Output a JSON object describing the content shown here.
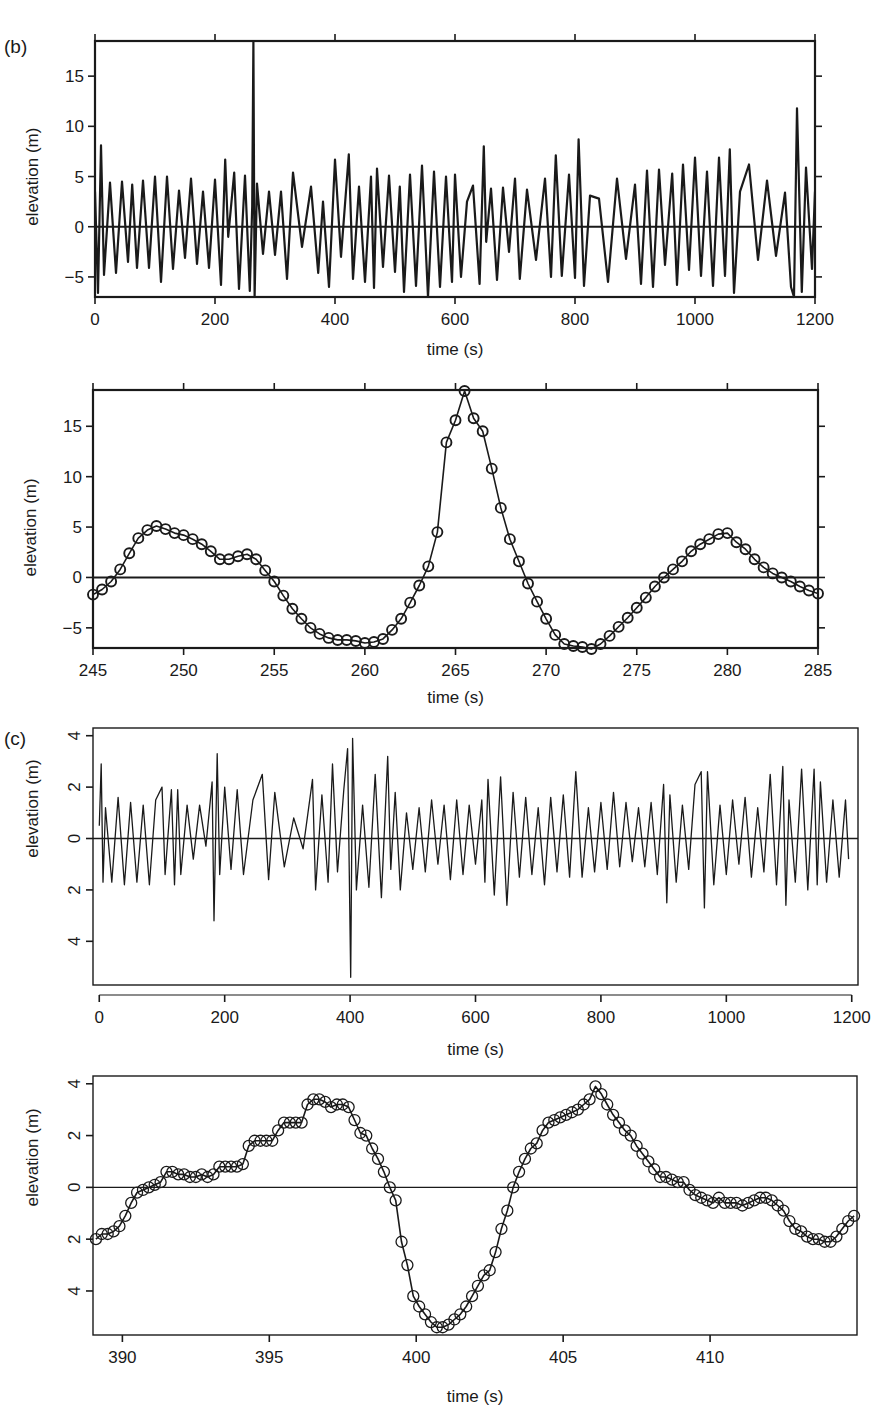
{
  "figure": {
    "panel_labels": {
      "b": "(b)",
      "c": "(c)"
    },
    "ink_color": "#1a1a1a",
    "background": "#ffffff"
  },
  "chart_data": [
    {
      "id": "b-full",
      "panel": "(b)",
      "type": "line",
      "title": "",
      "xlabel": "time (s)",
      "ylabel": "elevation (m)",
      "xlim": [
        0,
        1200
      ],
      "ylim": [
        -7,
        18.5
      ],
      "xticks": [
        0,
        200,
        400,
        600,
        800,
        1000,
        1200
      ],
      "xtick_labels": [
        "0",
        "200",
        "400",
        "600",
        "800",
        "1000",
        "1200"
      ],
      "yticks": [
        -5,
        0,
        5,
        10,
        15
      ],
      "ytick_labels": [
        "−5",
        "0",
        "5",
        "10",
        "15"
      ],
      "zero_line": true,
      "grid": false,
      "markers": false,
      "description": "Wave elevation record ~1200 s long, typical amplitude ±5 m with a single rogue peak near t=264 s reaching ~18.5 m",
      "x": [
        0,
        5,
        10,
        15,
        25,
        35,
        45,
        55,
        62,
        70,
        80,
        90,
        100,
        110,
        120,
        130,
        140,
        150,
        160,
        170,
        180,
        190,
        200,
        210,
        217,
        222,
        232,
        240,
        250,
        258,
        262,
        264,
        266,
        270,
        280,
        290,
        300,
        310,
        320,
        330,
        345,
        360,
        372,
        380,
        390,
        400,
        410,
        423,
        430,
        440,
        450,
        460,
        465,
        470,
        480,
        490,
        500,
        508,
        515,
        525,
        535,
        545,
        555,
        565,
        575,
        585,
        595,
        600,
        610,
        620,
        630,
        641,
        648,
        652,
        660,
        670,
        680,
        690,
        700,
        708,
        720,
        735,
        750,
        760,
        768,
        778,
        790,
        800,
        806,
        815,
        825,
        840,
        855,
        870,
        885,
        900,
        910,
        920,
        930,
        940,
        950,
        962,
        970,
        980,
        990,
        1000,
        1010,
        1020,
        1030,
        1040,
        1050,
        1058,
        1065,
        1075,
        1090,
        1105,
        1120,
        1135,
        1150,
        1160,
        1165,
        1170,
        1178,
        1185,
        1195,
        1200
      ],
      "y": [
        3.5,
        -6.6,
        8.1,
        -4.8,
        4.4,
        -4.6,
        4.5,
        -3.5,
        4.2,
        -4.1,
        4.6,
        -4.1,
        5.0,
        -5.5,
        5.0,
        -4.2,
        3.6,
        -3.1,
        4.8,
        -3.7,
        3.5,
        -4.1,
        4.7,
        -5.8,
        6.7,
        -1.0,
        5.4,
        -6.2,
        5.1,
        -6.4,
        2.0,
        18.5,
        -7.0,
        4.3,
        -2.7,
        3.5,
        -2.8,
        3.5,
        -5.2,
        5.4,
        -2.0,
        4.0,
        -4.6,
        2.5,
        -6.0,
        6.7,
        -3.0,
        7.2,
        -5.2,
        4.0,
        -5.5,
        5.0,
        -6.1,
        5.8,
        -4.0,
        5.1,
        -4.5,
        4.0,
        -6.5,
        5.2,
        -5.9,
        6.1,
        -7.0,
        5.5,
        -6.0,
        5.0,
        -5.5,
        5.2,
        -5.0,
        2.5,
        4.1,
        -5.7,
        8.0,
        -1.5,
        3.8,
        -5.3,
        3.9,
        -2.5,
        4.8,
        -5.2,
        3.7,
        -3.3,
        4.8,
        -5.0,
        7.1,
        -4.9,
        5.2,
        -5.1,
        8.7,
        -5.9,
        3.1,
        2.8,
        -5.5,
        4.8,
        -3.2,
        4.2,
        -5.7,
        5.6,
        -6.0,
        5.7,
        -3.8,
        5.3,
        -5.8,
        6.2,
        -4.3,
        6.9,
        -4.9,
        5.5,
        -5.9,
        6.9,
        -4.9,
        7.7,
        -6.6,
        3.5,
        6.2,
        -3.3,
        4.6,
        -2.9,
        3.4,
        -6.0,
        -7.0,
        11.8,
        -6.5,
        5.9,
        -4.2,
        3.5
      ]
    },
    {
      "id": "b-zoom",
      "panel": "(b)",
      "type": "line",
      "title": "",
      "xlabel": "time (s)",
      "ylabel": "elevation (m)",
      "xlim": [
        245,
        285
      ],
      "ylim": [
        -7,
        18.6
      ],
      "xticks": [
        245,
        250,
        255,
        260,
        265,
        270,
        275,
        280,
        285
      ],
      "xtick_labels": [
        "245",
        "250",
        "255",
        "260",
        "265",
        "270",
        "275",
        "280",
        "285"
      ],
      "yticks": [
        -5,
        0,
        5,
        10,
        15
      ],
      "ytick_labels": [
        "−5",
        "0",
        "5",
        "10",
        "15"
      ],
      "zero_line": true,
      "grid": false,
      "markers": true,
      "marker": "open-circle",
      "x": [
        245.0,
        245.5,
        246.0,
        246.5,
        247.0,
        247.5,
        248.0,
        248.5,
        249.0,
        249.5,
        250.0,
        250.5,
        251.0,
        251.5,
        252.0,
        252.5,
        253.0,
        253.5,
        254.0,
        254.5,
        255.0,
        255.5,
        256.0,
        256.5,
        257.0,
        257.5,
        258.0,
        258.5,
        259.0,
        259.5,
        260.0,
        260.5,
        261.0,
        261.5,
        262.0,
        262.5,
        263.0,
        263.5,
        264.0,
        264.5,
        265.0,
        265.5,
        266.0,
        266.5,
        267.0,
        267.5,
        268.0,
        268.5,
        269.0,
        269.5,
        270.0,
        270.5,
        271.0,
        271.5,
        272.0,
        272.5,
        273.0,
        273.5,
        274.0,
        274.5,
        275.0,
        275.5,
        276.0,
        276.5,
        277.0,
        277.5,
        278.0,
        278.5,
        279.0,
        279.5,
        280.0,
        280.5,
        281.0,
        281.5,
        282.0,
        282.5,
        283.0,
        283.5,
        284.0,
        284.5,
        285.0
      ],
      "y": [
        -1.7,
        -1.2,
        -0.4,
        0.8,
        2.4,
        3.9,
        4.7,
        5.1,
        4.8,
        4.4,
        4.2,
        3.8,
        3.3,
        2.6,
        1.8,
        1.8,
        2.1,
        2.3,
        1.8,
        0.7,
        -0.4,
        -1.8,
        -3.1,
        -4.1,
        -5.0,
        -5.6,
        -6.0,
        -6.2,
        -6.2,
        -6.3,
        -6.5,
        -6.4,
        -6.1,
        -5.2,
        -4.1,
        -2.5,
        -0.8,
        1.1,
        4.5,
        13.4,
        15.6,
        18.5,
        15.8,
        14.5,
        10.8,
        6.9,
        3.8,
        1.6,
        -0.6,
        -2.4,
        -4.1,
        -5.7,
        -6.6,
        -6.8,
        -6.9,
        -7.1,
        -6.6,
        -5.8,
        -4.9,
        -4.0,
        -3.0,
        -2.0,
        -0.9,
        0.0,
        0.8,
        1.6,
        2.6,
        3.3,
        3.8,
        4.3,
        4.4,
        3.5,
        2.8,
        1.8,
        1.0,
        0.4,
        0.0,
        -0.4,
        -0.9,
        -1.3,
        -1.6,
        -2.0,
        -2.2,
        -2.3,
        -2.3,
        -2.4,
        -2.0
      ]
    },
    {
      "id": "c-full",
      "panel": "(c)",
      "type": "line",
      "title": "",
      "xlabel": "time (s)",
      "ylabel": "elevation (m)",
      "xlim": [
        -10,
        1210
      ],
      "ylim": [
        -5.7,
        4.3
      ],
      "xticks": [
        0,
        200,
        400,
        600,
        800,
        1000,
        1200
      ],
      "xtick_labels": [
        "0",
        "200",
        "400",
        "600",
        "800",
        "1000",
        "1200"
      ],
      "yticks": [
        -4,
        -2,
        0,
        2,
        4
      ],
      "ytick_labels": [
        "4",
        "2",
        "0",
        "2",
        "4"
      ],
      "ytick_labels_rotated": true,
      "zero_line": true,
      "grid": false,
      "markers": false,
      "description": "Wave elevation record ~1200 s long, typical amplitude ±2 m with a rogue event near t=400 s (peak ~3.9 m, trough ~-5.4 m)",
      "x": [
        0,
        3,
        6,
        10,
        20,
        30,
        40,
        50,
        60,
        70,
        80,
        90,
        100,
        105,
        115,
        120,
        125,
        130,
        140,
        150,
        160,
        170,
        180,
        183,
        188,
        192,
        200,
        210,
        220,
        230,
        245,
        260,
        270,
        280,
        295,
        310,
        325,
        340,
        345,
        355,
        365,
        372,
        380,
        390,
        396,
        401,
        404,
        410,
        420,
        430,
        440,
        450,
        460,
        465,
        472,
        480,
        490,
        500,
        510,
        520,
        530,
        540,
        550,
        560,
        570,
        580,
        590,
        600,
        610,
        615,
        620,
        630,
        640,
        650,
        660,
        670,
        680,
        690,
        700,
        710,
        720,
        730,
        740,
        750,
        760,
        770,
        780,
        790,
        800,
        810,
        820,
        830,
        840,
        850,
        860,
        870,
        880,
        890,
        900,
        905,
        910,
        920,
        930,
        940,
        950,
        960,
        965,
        970,
        980,
        990,
        1000,
        1010,
        1020,
        1030,
        1040,
        1050,
        1060,
        1070,
        1080,
        1090,
        1095,
        1100,
        1110,
        1120,
        1130,
        1140,
        1145,
        1150,
        1160,
        1170,
        1180,
        1190,
        1195
      ],
      "y": [
        0.5,
        2.9,
        -1.7,
        1.2,
        -1.7,
        1.6,
        -1.8,
        1.4,
        -1.7,
        1.3,
        -1.8,
        1.5,
        2.0,
        -1.4,
        1.9,
        -1.8,
        1.9,
        -1.4,
        1.3,
        -0.8,
        1.3,
        -0.3,
        2.2,
        -3.2,
        3.3,
        -1.4,
        2.0,
        -1.2,
        1.9,
        -1.4,
        1.5,
        2.5,
        -1.6,
        1.8,
        -1.1,
        0.8,
        -0.4,
        2.3,
        -2.0,
        1.7,
        -1.7,
        2.9,
        -1.3,
        1.9,
        3.5,
        -5.4,
        3.9,
        -2.0,
        1.3,
        -1.9,
        2.5,
        -2.3,
        3.2,
        -1.2,
        1.8,
        -2.0,
        1.0,
        -1.2,
        1.2,
        -1.3,
        1.5,
        -1.0,
        1.3,
        -1.6,
        1.5,
        -1.4,
        1.3,
        -1.0,
        1.5,
        -1.7,
        2.3,
        -2.2,
        2.4,
        -2.6,
        1.8,
        -1.5,
        1.6,
        -1.4,
        1.2,
        -1.8,
        1.6,
        -1.3,
        1.7,
        -1.5,
        2.6,
        -1.5,
        1.2,
        -1.3,
        1.4,
        -1.2,
        1.8,
        -1.1,
        1.4,
        -0.9,
        1.2,
        -1.1,
        1.4,
        -1.4,
        2.1,
        -2.5,
        1.7,
        -1.7,
        1.3,
        -1.2,
        2.1,
        2.6,
        -2.7,
        2.6,
        -1.8,
        1.3,
        -1.4,
        1.5,
        -1.0,
        1.6,
        -1.5,
        1.2,
        -1.3,
        2.5,
        -1.8,
        2.8,
        -2.6,
        1.5,
        -1.7,
        2.7,
        -2.0,
        2.7,
        -1.8,
        2.2,
        -1.7,
        1.5,
        -1.5,
        1.5,
        -0.8
      ]
    },
    {
      "id": "c-zoom",
      "panel": "(c)",
      "type": "line",
      "title": "",
      "xlabel": "time (s)",
      "ylabel": "elevation (m)",
      "xlim": [
        389,
        415
      ],
      "ylim": [
        -5.7,
        4.3
      ],
      "xticks": [
        390,
        395,
        400,
        405,
        410
      ],
      "xtick_labels": [
        "390",
        "395",
        "400",
        "405",
        "410"
      ],
      "yticks": [
        -4,
        -2,
        0,
        2,
        4
      ],
      "ytick_labels": [
        "4",
        "2",
        "0",
        "2",
        "4"
      ],
      "ytick_labels_rotated": true,
      "zero_line": true,
      "grid": false,
      "markers": true,
      "marker": "open-circle",
      "x": [
        389.1,
        389.3,
        389.5,
        389.7,
        389.9,
        390.1,
        390.3,
        390.5,
        390.7,
        390.9,
        391.1,
        391.3,
        391.5,
        391.7,
        391.9,
        392.1,
        392.3,
        392.5,
        392.7,
        392.9,
        393.1,
        393.3,
        393.5,
        393.7,
        393.9,
        394.1,
        394.3,
        394.5,
        394.7,
        394.9,
        395.1,
        395.3,
        395.5,
        395.7,
        395.9,
        396.1,
        396.3,
        396.5,
        396.7,
        396.9,
        397.1,
        397.3,
        397.5,
        397.7,
        397.9,
        398.1,
        398.3,
        398.5,
        398.7,
        398.9,
        399.1,
        399.3,
        399.5,
        399.7,
        399.9,
        400.1,
        400.3,
        400.5,
        400.7,
        400.9,
        401.1,
        401.3,
        401.5,
        401.7,
        401.9,
        402.1,
        402.3,
        402.5,
        402.7,
        402.9,
        403.1,
        403.3,
        403.5,
        403.7,
        403.9,
        404.1,
        404.3,
        404.5,
        404.7,
        404.9,
        405.1,
        405.3,
        405.5,
        405.7,
        405.9,
        406.1,
        406.3,
        406.5,
        406.7,
        406.9,
        407.1,
        407.3,
        407.5,
        407.7,
        407.9,
        408.1,
        408.3,
        408.5,
        408.7,
        408.9,
        409.1,
        409.3,
        409.5,
        409.7,
        409.9,
        410.1,
        410.3,
        410.5,
        410.7,
        410.9,
        411.1,
        411.3,
        411.5,
        411.7,
        411.9,
        412.1,
        412.3,
        412.5,
        412.7,
        412.9,
        413.1,
        413.3,
        413.5,
        413.7,
        413.9,
        414.1,
        414.3,
        414.5,
        414.7,
        414.9
      ],
      "y": [
        -2.0,
        -1.8,
        -1.8,
        -1.7,
        -1.5,
        -1.1,
        -0.6,
        -0.2,
        -0.1,
        0.0,
        0.1,
        0.2,
        0.6,
        0.6,
        0.5,
        0.5,
        0.4,
        0.4,
        0.5,
        0.4,
        0.5,
        0.8,
        0.8,
        0.8,
        0.8,
        0.9,
        1.6,
        1.8,
        1.8,
        1.8,
        1.8,
        2.2,
        2.5,
        2.5,
        2.5,
        2.5,
        3.2,
        3.4,
        3.4,
        3.3,
        3.1,
        3.2,
        3.2,
        3.1,
        2.6,
        2.1,
        2.0,
        1.5,
        1.1,
        0.6,
        0.0,
        -0.5,
        -2.1,
        -3.0,
        -4.2,
        -4.6,
        -4.9,
        -5.2,
        -5.4,
        -5.4,
        -5.3,
        -5.1,
        -4.9,
        -4.6,
        -4.2,
        -3.8,
        -3.4,
        -3.2,
        -2.5,
        -1.6,
        -0.9,
        0.0,
        0.6,
        1.1,
        1.5,
        1.7,
        2.2,
        2.5,
        2.6,
        2.7,
        2.8,
        2.9,
        3.0,
        3.2,
        3.4,
        3.9,
        3.6,
        3.2,
        2.8,
        2.5,
        2.2,
        2.0,
        1.6,
        1.3,
        1.0,
        0.7,
        0.4,
        0.4,
        0.3,
        0.2,
        0.2,
        -0.1,
        -0.3,
        -0.4,
        -0.5,
        -0.6,
        -0.4,
        -0.6,
        -0.6,
        -0.6,
        -0.7,
        -0.6,
        -0.5,
        -0.4,
        -0.4,
        -0.5,
        -0.7,
        -0.9,
        -1.3,
        -1.6,
        -1.7,
        -1.9,
        -2.0,
        -2.0,
        -2.1,
        -2.1,
        -1.9,
        -1.6,
        -1.3,
        -1.1
      ]
    }
  ]
}
